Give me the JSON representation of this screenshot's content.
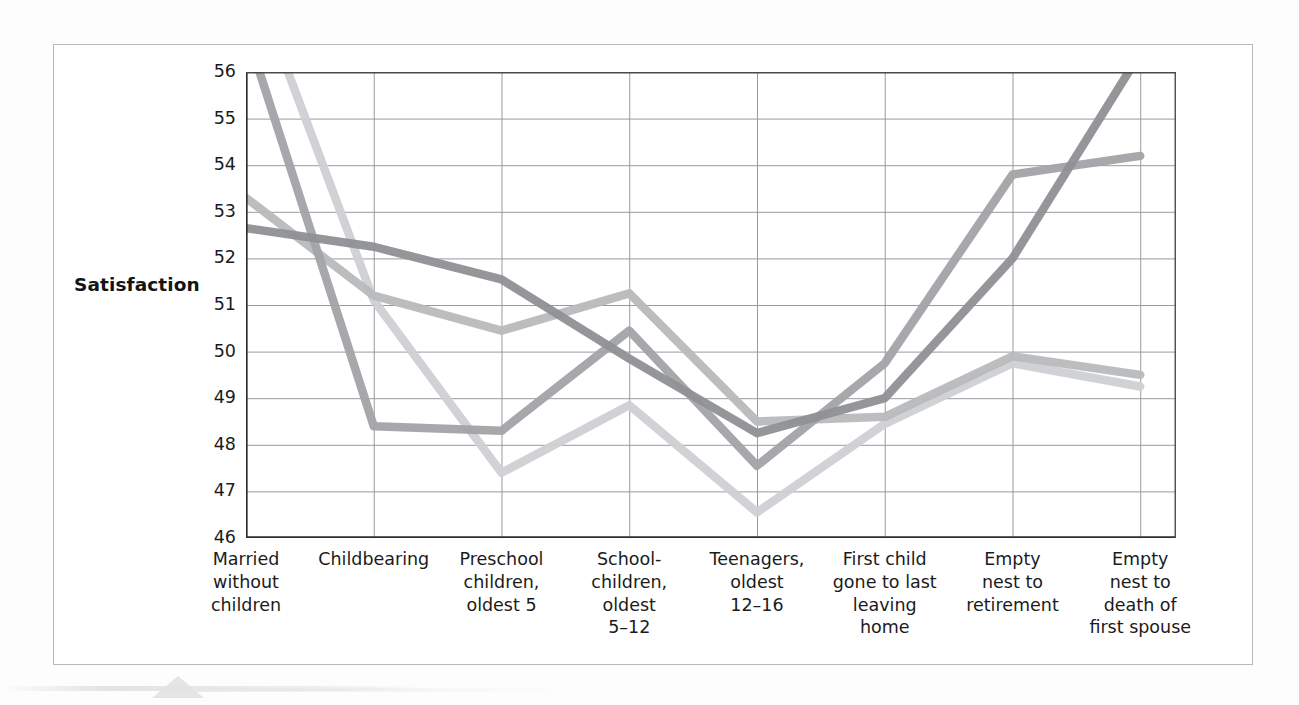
{
  "figure": {
    "axis_label_y": "Satisfaction"
  },
  "chart_data": {
    "type": "line",
    "title": "",
    "xlabel": "",
    "ylabel": "Satisfaction",
    "ylim": [
      46,
      56
    ],
    "ytick_labels": [
      "56",
      "55",
      "54",
      "53",
      "52",
      "51",
      "50",
      "49",
      "48",
      "47",
      "46"
    ],
    "yticks": [
      56,
      55,
      54,
      53,
      52,
      51,
      50,
      49,
      48,
      47,
      46
    ],
    "grid": true,
    "legend": "none",
    "categories": [
      "Married\nwithout\nchildren",
      "Childbearing",
      "Preschool\nchildren,\noldest 5",
      "School-\nchildren,\noldest\n5–12",
      "Teenagers,\noldest\n12–16",
      "First child\ngone to last\nleaving\nhome",
      "Empty\nnest to\nretirement",
      "Empty\nnest to\ndeath of\nfirst spouse"
    ],
    "series": [
      {
        "name": "series-1-dark-gray",
        "color": "#8f9093",
        "values": [
          52.65,
          52.25,
          51.55,
          49.85,
          48.25,
          49.0,
          52.0,
          56.4
        ]
      },
      {
        "name": "series-2-medium-gray",
        "color": "#a2a3a6",
        "values": [
          56.9,
          48.4,
          48.3,
          50.45,
          47.55,
          49.75,
          53.8,
          54.2
        ]
      },
      {
        "name": "series-3-light-gray",
        "color": "#b8b9bc",
        "values": [
          53.3,
          51.2,
          50.45,
          51.25,
          48.5,
          48.6,
          49.9,
          49.5
        ]
      },
      {
        "name": "series-4-pale-gray",
        "color": "#cfd0d3",
        "values": [
          58.4,
          51.1,
          47.4,
          48.85,
          46.55,
          48.45,
          49.75,
          49.25
        ]
      }
    ]
  }
}
